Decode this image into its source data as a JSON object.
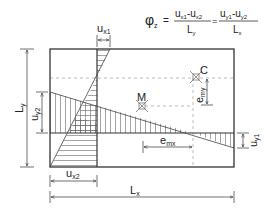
{
  "formula": {
    "lhs": "φ",
    "lhs_sub": "z",
    "eq1": "=",
    "frac1_num_a": "u",
    "frac1_num_a_sub": "x1",
    "frac1_minus": "-",
    "frac1_num_b": "u",
    "frac1_num_b_sub": "x2",
    "frac1_den": "L",
    "frac1_den_sub": "y",
    "eq2": "=",
    "frac2_num_a": "u",
    "frac2_num_a_sub": "y1",
    "frac2_minus": "-",
    "frac2_num_b": "u",
    "frac2_num_b_sub": "y2",
    "frac2_den": "L",
    "frac2_den_sub": "x"
  },
  "labels": {
    "ux1": {
      "base": "u",
      "sub": "x1"
    },
    "ux2": {
      "base": "u",
      "sub": "x2"
    },
    "uy1": {
      "base": "u",
      "sub": "y1"
    },
    "uy2": {
      "base": "u",
      "sub": "y2"
    },
    "Lx": {
      "base": "L",
      "sub": "x"
    },
    "Ly": {
      "base": "L",
      "sub": "y"
    },
    "emx": {
      "base": "e",
      "sub": "mx"
    },
    "emy": {
      "base": "e",
      "sub": "my"
    },
    "C": "C",
    "M": "M"
  },
  "colors": {
    "line": "#333333",
    "dashed": "#aaaaaa",
    "hatch": "#555555"
  }
}
